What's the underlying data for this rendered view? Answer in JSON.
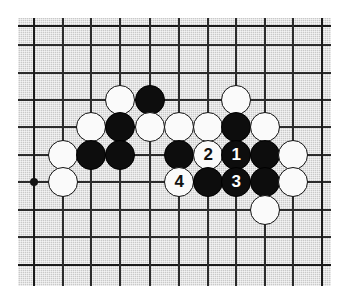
{
  "diagram": {
    "kind": "go-board-diagram",
    "board": {
      "background_color": "#c9c9c9",
      "line_color": "#2b2b2b",
      "origin_x": 18,
      "origin_y": 18,
      "width": 313,
      "height": 268,
      "grid_spacing": 28.8,
      "column_x": [
        15,
        44,
        72,
        101,
        131,
        160,
        189,
        217,
        246,
        274,
        303
      ],
      "row_y": [
        7,
        26,
        54,
        81,
        108,
        136,
        163,
        191,
        218,
        246
      ],
      "columns": 11,
      "rows": 10
    },
    "star_points": [
      {
        "name": "star-point-left",
        "x": 15,
        "y": 163
      }
    ],
    "stones": [
      {
        "id": "w-c4-r3",
        "color": "white",
        "x": 101,
        "y": 81,
        "label": ""
      },
      {
        "id": "b-c5-r3",
        "color": "black",
        "x": 131,
        "y": 81,
        "label": ""
      },
      {
        "id": "w-c8-r3",
        "color": "white",
        "x": 217,
        "y": 81,
        "label": ""
      },
      {
        "id": "w-c3-r4",
        "color": "white",
        "x": 72,
        "y": 108,
        "label": ""
      },
      {
        "id": "b-c4-r4",
        "color": "black",
        "x": 101,
        "y": 108,
        "label": ""
      },
      {
        "id": "w-c5-r4",
        "color": "white",
        "x": 131,
        "y": 108,
        "label": ""
      },
      {
        "id": "w-c6-r4",
        "color": "white",
        "x": 160,
        "y": 108,
        "label": ""
      },
      {
        "id": "w-c7-r4",
        "color": "white",
        "x": 189,
        "y": 108,
        "label": ""
      },
      {
        "id": "b-c8-r4",
        "color": "black",
        "x": 217,
        "y": 108,
        "label": ""
      },
      {
        "id": "w-c9-r4",
        "color": "white",
        "x": 246,
        "y": 108,
        "label": ""
      },
      {
        "id": "w-c2-r5",
        "color": "white",
        "x": 44,
        "y": 136,
        "label": ""
      },
      {
        "id": "b-c3-r5",
        "color": "black",
        "x": 72,
        "y": 136,
        "label": ""
      },
      {
        "id": "b-c4-r5",
        "color": "black",
        "x": 101,
        "y": 136,
        "label": ""
      },
      {
        "id": "b-c6-r5",
        "color": "black",
        "x": 160,
        "y": 136,
        "label": ""
      },
      {
        "id": "move-2",
        "color": "white",
        "x": 189,
        "y": 136,
        "label": "2"
      },
      {
        "id": "move-1",
        "color": "black",
        "x": 217,
        "y": 136,
        "label": "1"
      },
      {
        "id": "b-c9-r5",
        "color": "black",
        "x": 246,
        "y": 136,
        "label": ""
      },
      {
        "id": "w-c10-r5",
        "color": "white",
        "x": 274,
        "y": 136,
        "label": ""
      },
      {
        "id": "w-c2-r6",
        "color": "white",
        "x": 44,
        "y": 163,
        "label": ""
      },
      {
        "id": "move-4",
        "color": "white",
        "x": 160,
        "y": 163,
        "label": "4"
      },
      {
        "id": "b-c7-r6",
        "color": "black",
        "x": 189,
        "y": 163,
        "label": ""
      },
      {
        "id": "move-3",
        "color": "black",
        "x": 217,
        "y": 163,
        "label": "3"
      },
      {
        "id": "b-c9-r6",
        "color": "black",
        "x": 246,
        "y": 163,
        "label": ""
      },
      {
        "id": "w-c10-r6",
        "color": "white",
        "x": 274,
        "y": 163,
        "label": ""
      },
      {
        "id": "w-c9-r7",
        "color": "white",
        "x": 246,
        "y": 191,
        "label": ""
      }
    ],
    "move_labels": [
      "1",
      "2",
      "3",
      "4"
    ]
  }
}
